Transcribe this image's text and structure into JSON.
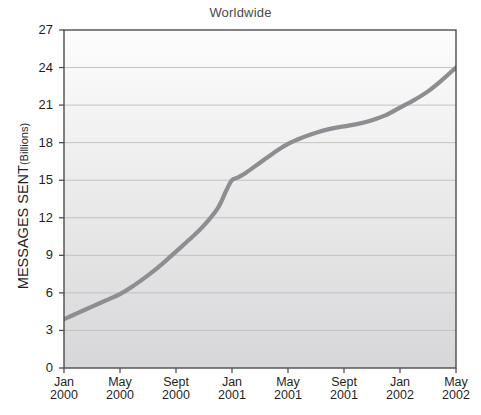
{
  "chart_data": {
    "type": "line",
    "title": "Worldwide",
    "xlabel": "",
    "ylabel": "MESSAGES SENT",
    "ylabel_unit": "(Billions)",
    "ylim": [
      0,
      27
    ],
    "yticks": [
      0,
      3,
      6,
      9,
      12,
      15,
      18,
      21,
      24,
      27
    ],
    "ytick_labels": [
      "0",
      "3",
      "6",
      "9",
      "12",
      "15",
      "18",
      "21",
      "24",
      "27"
    ],
    "xtick_labels": [
      {
        "month": "Jan",
        "year": "2000"
      },
      {
        "month": "May",
        "year": "2000"
      },
      {
        "month": "Sept",
        "year": "2000"
      },
      {
        "month": "Jan",
        "year": "2001"
      },
      {
        "month": "May",
        "year": "2001"
      },
      {
        "month": "Sept",
        "year": "2001"
      },
      {
        "month": "Jan",
        "year": "2002"
      },
      {
        "month": "May",
        "year": "2002"
      }
    ],
    "x_months": [
      0,
      4,
      8,
      12,
      16,
      20,
      24,
      28
    ],
    "xlim": [
      0,
      28
    ],
    "grid": "horizontal",
    "legend": "none",
    "series": [
      {
        "name": "Messages sent worldwide",
        "color": "#8d8d92",
        "x": [
          0,
          1,
          2,
          3,
          4,
          5,
          6,
          7,
          8,
          9,
          10,
          11,
          11.6,
          12,
          12.4,
          13,
          14,
          15,
          16,
          17,
          18,
          19,
          20,
          21,
          22,
          23,
          24,
          25,
          26,
          27,
          28
        ],
        "values": [
          3.9,
          4.4,
          4.9,
          5.4,
          5.9,
          6.6,
          7.4,
          8.3,
          9.3,
          10.3,
          11.4,
          12.8,
          14.2,
          15.0,
          15.2,
          15.6,
          16.4,
          17.2,
          17.9,
          18.4,
          18.8,
          19.1,
          19.3,
          19.5,
          19.8,
          20.2,
          20.8,
          21.4,
          22.1,
          23.0,
          24.0
        ]
      }
    ],
    "background": {
      "gradient_top": "#fdfdfd",
      "gradient_bottom": "#d7d7d9",
      "grid_color": "#bdbdbd",
      "axis_color": "#4d4d4d"
    }
  }
}
